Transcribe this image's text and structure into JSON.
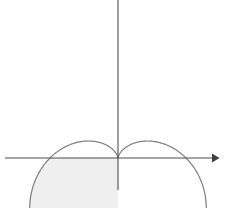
{
  "figure": {
    "title": "",
    "caption": "",
    "background_color": "#ffffff",
    "width": 229,
    "height": 208
  },
  "chart_data": {
    "type": "line",
    "plot_kind": "polar-curve-with-shaded-region",
    "title": "",
    "subtitle": "",
    "xlabel": "",
    "ylabel": "",
    "grid": false,
    "legend": null,
    "annotations": [],
    "curve": {
      "name": "cardioid",
      "equation_polar": "r = a(1 - sin(theta))",
      "equation_note": "cardioid with cusp at the origin opening upward",
      "stroke_color": "#7d7d7d",
      "stroke_width": 1.2,
      "closed": true,
      "cusp_point": {
        "x": 0,
        "y": 0
      },
      "top_point": {
        "x": 0,
        "y": 2
      },
      "leftmost_point": {
        "x": -1.2990381,
        "y": 0.75
      },
      "rightmost_point": {
        "x": 1.2990381,
        "y": 0.75
      },
      "x_axis_crossings": [
        {
          "x": -1.0,
          "y": 0
        },
        {
          "x": 0.0,
          "y": 0
        },
        {
          "x": 1.0,
          "y": 0
        }
      ],
      "lobe_minimum_left": {
        "x": -0.6495191,
        "y": -0.25
      },
      "lobe_minimum_right": {
        "x": 0.6495191,
        "y": -0.25
      },
      "theta_samples_deg": [
        0,
        15,
        30,
        45,
        60,
        75,
        90,
        105,
        120,
        135,
        150,
        165,
        180,
        195,
        210,
        225,
        240,
        255,
        270,
        285,
        300,
        315,
        330,
        345,
        360
      ],
      "r_values": [
        1.0,
        0.7411809,
        0.5,
        0.2928932,
        0.1339746,
        0.0341081,
        0.0,
        0.0341081,
        0.1339746,
        0.2928932,
        0.5,
        0.7411809,
        1.0,
        1.2588191,
        1.5,
        1.7071068,
        1.8660254,
        1.9658919,
        2.0,
        1.9658919,
        1.8660254,
        1.7071068,
        1.5,
        1.2588191,
        1.0
      ]
    },
    "shaded_region": {
      "label": "shaded area",
      "fill_color": "#efefef",
      "description": "region bounded by the left half of the cardioid above the x-axis",
      "x_range": [
        -1.2990381,
        0.0
      ],
      "y_range": [
        0.0,
        2.0
      ],
      "bounded_below_by": "x-axis",
      "bounded_right_by": "y-axis",
      "theta_range_deg": [
        180,
        360
      ]
    },
    "axes": {
      "x_axis": {
        "name": "x-axis",
        "color": "#4d4d4d",
        "has_arrow_head": true,
        "arrow_side": "right",
        "pixel_y": 158,
        "pixel_x_start": 5,
        "pixel_x_end": 218,
        "tick_labels": []
      },
      "y_axis": {
        "name": "y-axis",
        "color": "#4d4d4d",
        "has_arrow_head": false,
        "pixel_x": 118,
        "pixel_y_start": 0,
        "pixel_y_end": 190,
        "tick_labels": []
      },
      "origin_pixel": {
        "x": 118,
        "y": 158
      },
      "scale_px_per_unit": 68,
      "xlim": [
        -1.66,
        1.47
      ],
      "ylim": [
        -0.47,
        2.32
      ]
    }
  }
}
